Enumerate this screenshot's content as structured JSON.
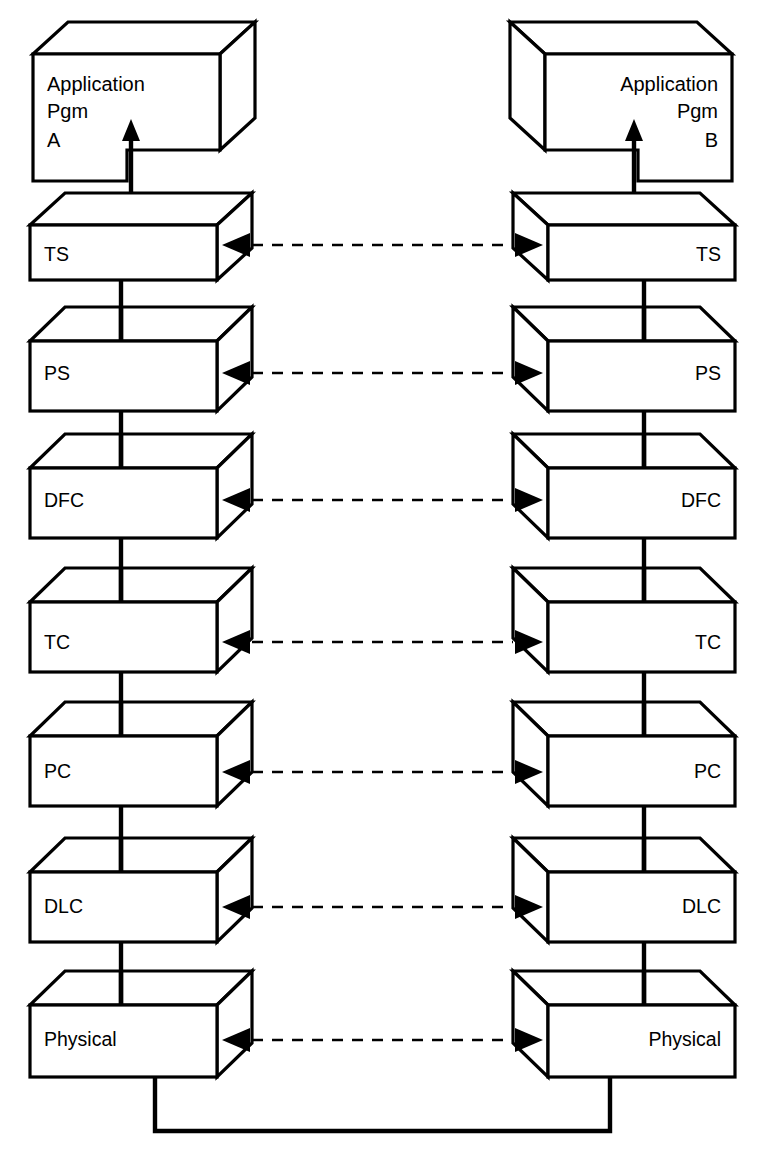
{
  "diagram": {
    "type": "layered-protocol-stack",
    "background_color": "#ffffff",
    "line_color": "#000000",
    "endpoints": [
      {
        "id": "left",
        "side": "left",
        "text_align": "left"
      },
      {
        "id": "right",
        "side": "right",
        "text_align": "right"
      }
    ],
    "application": {
      "left": {
        "lines": [
          "Application",
          "Pgm",
          "A"
        ],
        "line1": "Application",
        "line2": "Pgm",
        "line3": "A"
      },
      "right": {
        "lines": [
          "Application",
          "Pgm",
          "B"
        ],
        "line1": "Application",
        "line2": "Pgm",
        "line3": "B"
      }
    },
    "layers": [
      {
        "index": 0,
        "abbr": "TS",
        "left_label": "TS",
        "right_label": "TS"
      },
      {
        "index": 1,
        "abbr": "PS",
        "left_label": "PS",
        "right_label": "PS"
      },
      {
        "index": 2,
        "abbr": "DFC",
        "left_label": "DFC",
        "right_label": "DFC"
      },
      {
        "index": 3,
        "abbr": "TC",
        "left_label": "TC",
        "right_label": "TC"
      },
      {
        "index": 4,
        "abbr": "PC",
        "left_label": "PC",
        "right_label": "PC"
      },
      {
        "index": 5,
        "abbr": "DLC",
        "left_label": "DLC",
        "right_label": "DLC"
      },
      {
        "index": 6,
        "abbr": "Physical",
        "left_label": "Physical",
        "right_label": "Physical"
      }
    ],
    "peer_links": {
      "style": "dashed",
      "arrow_left": "arrowhead-left",
      "arrow_right": "arrowhead-right",
      "count": 7
    },
    "vertical_links": {
      "style": "solid",
      "description": "solid vertical connector between adjacent layers"
    },
    "service_arrows": {
      "style": "solid-up-arrow",
      "description": "upward arrow from TS into Application Pgm"
    },
    "physical_medium": {
      "style": "solid",
      "description": "solid U-shaped line joining the two Physical layers"
    }
  }
}
